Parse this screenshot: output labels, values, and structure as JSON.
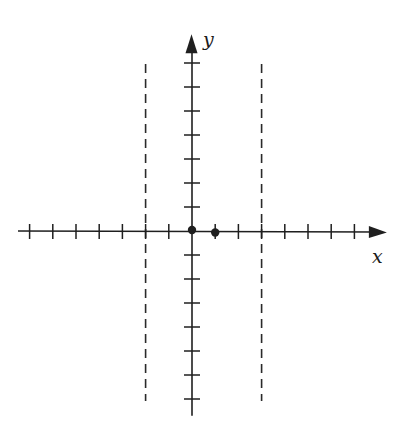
{
  "diagram": {
    "type": "coordinate-plane",
    "colors": {
      "ink": "#1f1f1f",
      "dashed": "#2a2a2a",
      "background": "#ffffff"
    },
    "axes": {
      "x_label": "x",
      "y_label": "y",
      "origin_px": [
        192,
        231
      ],
      "unit_px_x": 23.2,
      "unit_px_y": 24,
      "x_range_units": [
        -7.5,
        8.4
      ],
      "y_range_units": [
        -7.7,
        8.2
      ],
      "x_ticks": [
        -7,
        -6,
        -5,
        -4,
        -3,
        -2,
        -1,
        1,
        2,
        3,
        4,
        5,
        6,
        7
      ],
      "y_ticks": [
        -7,
        -6,
        -5,
        -4,
        -3,
        -2,
        -1,
        1,
        2,
        3,
        4,
        5,
        6,
        7
      ]
    },
    "asymptotes": [
      {
        "name": "left-vertical-asymptote",
        "x": -2,
        "style": "dashed"
      },
      {
        "name": "right-vertical-asymptote",
        "x": 3,
        "style": "dashed"
      }
    ],
    "points": [
      {
        "name": "origin-point",
        "x": 0,
        "y": 0
      },
      {
        "name": "point-at-x1",
        "x": 1,
        "y": 0
      }
    ]
  }
}
